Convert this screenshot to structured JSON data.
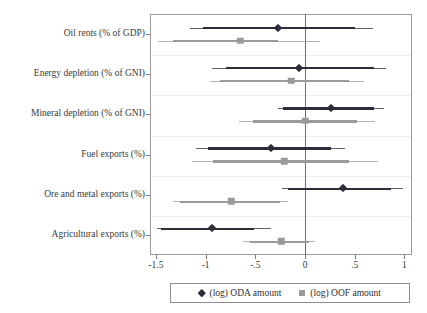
{
  "chart_data": {
    "type": "scatter",
    "title": "",
    "subtitle": "",
    "xlabel": "",
    "ylabel": "",
    "xlim": [
      -1.65,
      1.08
    ],
    "grid": false,
    "legend_position": "bottom",
    "xticks": [
      -1.5,
      -1,
      -0.5,
      0,
      0.5,
      1
    ],
    "xticklabels": [
      "-1.5",
      "-1",
      "-.5",
      "0",
      ".5",
      "1"
    ],
    "categories": [
      "Oil rents (% of GDP)",
      "Energy depletion (% of GNI)",
      "Mineral depletion (% of GNI)",
      "Fuel exports (%)",
      "Ore and metal exports (%)",
      "Agricultural exports (%)"
    ],
    "series": [
      {
        "name": "(log) ODA amount",
        "marker": "diamond",
        "color": "#2e2e3a",
        "values": [
          -0.27,
          -0.06,
          0.26,
          -0.34,
          0.38,
          -0.94
        ],
        "ci_inner_low": [
          -1.03,
          -0.79,
          -0.22,
          -0.98,
          -0.17,
          -1.45
        ],
        "ci_inner_high": [
          0.5,
          0.69,
          0.69,
          0.26,
          0.87,
          -0.51
        ],
        "ci_outer_low": [
          -1.16,
          -0.94,
          -0.27,
          -1.1,
          -0.23,
          -1.49
        ],
        "ci_outer_high": [
          0.68,
          0.81,
          0.79,
          0.4,
          0.99,
          -0.34
        ]
      },
      {
        "name": "(log) OOF amount",
        "marker": "square",
        "color": "#9a9a9a",
        "values": [
          -0.65,
          -0.14,
          0.0,
          -0.21,
          -0.74,
          -0.24
        ],
        "ci_inner_low": [
          -1.33,
          -0.86,
          -0.52,
          -0.93,
          -1.26,
          -0.55
        ],
        "ci_inner_high": [
          -0.27,
          0.44,
          0.52,
          0.44,
          -0.25,
          0.04
        ],
        "ci_outer_low": [
          -1.48,
          -0.96,
          -0.66,
          -1.14,
          -1.33,
          -0.62
        ],
        "ci_outer_high": [
          0.15,
          0.59,
          0.7,
          0.73,
          -0.17,
          0.1
        ]
      }
    ],
    "legend": [
      {
        "label": "(log) ODA amount",
        "marker": "diamond",
        "color": "#2e2e3a"
      },
      {
        "label": "(log) OOF amount",
        "marker": "square",
        "color": "#9a9a9a"
      }
    ]
  }
}
